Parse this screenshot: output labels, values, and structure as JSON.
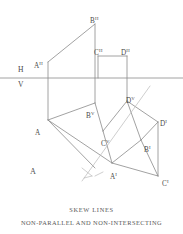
{
  "figure": {
    "panel_label": "A",
    "caption_title": "SKEW LINES",
    "caption_subtitle": "NON-PARALLEL  AND  NON-INTERSECTING",
    "stroke_color": "#8a8a8a",
    "light_stroke_color": "#b9b9b9",
    "text_color": "#4a4a4a",
    "background_color": "#ffffff"
  },
  "reference_plane": {
    "horizontal_label": "H",
    "vertical_label": "V",
    "ground_line_y": 78
  },
  "points": [
    {
      "id": "AH",
      "base": "A",
      "plane": "H",
      "label_x": 34,
      "label_y": 63,
      "x": 48,
      "y": 62
    },
    {
      "id": "BH",
      "base": "B",
      "plane": "H",
      "label_x": 90,
      "label_y": 18,
      "x": 95,
      "y": 24
    },
    {
      "id": "CH",
      "base": "C",
      "plane": "H",
      "label_x": 94,
      "label_y": 50,
      "x": 98,
      "y": 56
    },
    {
      "id": "DH",
      "base": "D",
      "plane": "H",
      "label_x": 121,
      "label_y": 50,
      "x": 127,
      "y": 56
    },
    {
      "id": "BV",
      "base": "B",
      "plane": "V",
      "label_x": 86,
      "label_y": 113,
      "x": 95,
      "y": 103
    },
    {
      "id": "CV",
      "base": "C",
      "plane": "V",
      "label_x": 101,
      "label_y": 141,
      "x": 103,
      "y": 131
    },
    {
      "id": "DV",
      "base": "D",
      "plane": "V",
      "label_x": 126,
      "label_y": 98,
      "x": 127,
      "y": 101
    },
    {
      "id": "AI",
      "base": "A",
      "plane": "I",
      "label_x": 110,
      "label_y": 174,
      "x": 112,
      "y": 163
    },
    {
      "id": "BI",
      "base": "B",
      "plane": "I",
      "label_x": 144,
      "label_y": 147,
      "x": 141,
      "y": 140
    },
    {
      "id": "CI",
      "base": "C",
      "plane": "I",
      "label_x": 162,
      "label_y": 181,
      "x": 158,
      "y": 176
    },
    {
      "id": "DI",
      "base": "D",
      "plane": "I",
      "label_x": 160,
      "label_y": 121,
      "x": 158,
      "y": 122
    },
    {
      "id": "A",
      "base": "A",
      "plane": "",
      "label_x": 35,
      "label_y": 130,
      "x": 48,
      "y": 120
    }
  ],
  "segments": [
    {
      "name": "ah-bh",
      "x1": 48,
      "y1": 62,
      "x2": 95,
      "y2": 24,
      "weight": "normal"
    },
    {
      "name": "bh-vertical",
      "x1": 95,
      "y1": 24,
      "x2": 95,
      "y2": 103,
      "weight": "normal"
    },
    {
      "name": "ch-dh",
      "x1": 98,
      "y1": 56,
      "x2": 127,
      "y2": 56,
      "weight": "normal"
    },
    {
      "name": "ch-vertical",
      "x1": 98,
      "y1": 56,
      "x2": 98,
      "y2": 78,
      "weight": "normal"
    },
    {
      "name": "dh-vertical",
      "x1": 127,
      "y1": 56,
      "x2": 127,
      "y2": 101,
      "weight": "normal"
    },
    {
      "name": "ah-a",
      "x1": 48,
      "y1": 62,
      "x2": 48,
      "y2": 120,
      "weight": "normal"
    },
    {
      "name": "ground-line",
      "x1": 0,
      "y1": 78,
      "x2": 183,
      "y2": 78,
      "weight": "normal"
    },
    {
      "name": "a-bv",
      "x1": 48,
      "y1": 120,
      "x2": 95,
      "y2": 103,
      "weight": "normal"
    },
    {
      "name": "a-ai",
      "x1": 48,
      "y1": 120,
      "x2": 112,
      "y2": 163,
      "weight": "normal"
    },
    {
      "name": "bv-cv",
      "x1": 95,
      "y1": 103,
      "x2": 103,
      "y2": 131,
      "weight": "normal"
    },
    {
      "name": "cv-dv",
      "x1": 103,
      "y1": 131,
      "x2": 127,
      "y2": 101,
      "weight": "normal"
    },
    {
      "name": "dv-di",
      "x1": 127,
      "y1": 101,
      "x2": 158,
      "y2": 122,
      "weight": "normal"
    },
    {
      "name": "cv-ai",
      "x1": 103,
      "y1": 131,
      "x2": 112,
      "y2": 163,
      "weight": "normal"
    },
    {
      "name": "ai-bi",
      "x1": 112,
      "y1": 163,
      "x2": 141,
      "y2": 140,
      "weight": "normal"
    },
    {
      "name": "bi-dv",
      "x1": 141,
      "y1": 140,
      "x2": 127,
      "y2": 101,
      "weight": "normal"
    },
    {
      "name": "bi-di",
      "x1": 141,
      "y1": 140,
      "x2": 158,
      "y2": 122,
      "weight": "normal"
    },
    {
      "name": "di-ci",
      "x1": 158,
      "y1": 122,
      "x2": 158,
      "y2": 176,
      "weight": "normal"
    },
    {
      "name": "ai-ci",
      "x1": 112,
      "y1": 163,
      "x2": 158,
      "y2": 176,
      "weight": "normal"
    },
    {
      "name": "bi-ci",
      "x1": 141,
      "y1": 140,
      "x2": 158,
      "y2": 176,
      "weight": "normal"
    },
    {
      "name": "lower-left-edge",
      "x1": 48,
      "y1": 120,
      "x2": 95,
      "y2": 168,
      "weight": "normal"
    },
    {
      "name": "skew-line",
      "x1": 150,
      "y1": 86,
      "x2": 82,
      "y2": 181,
      "weight": "light"
    },
    {
      "name": "skew-tail",
      "x1": 95,
      "y1": 176,
      "x2": 103,
      "y2": 172,
      "weight": "light"
    },
    {
      "name": "arrow-stroke1",
      "x1": 82,
      "y1": 168,
      "x2": 92,
      "y2": 176,
      "weight": "light"
    },
    {
      "name": "arrow-stroke2",
      "x1": 92,
      "y1": 176,
      "x2": 84,
      "y2": 178,
      "weight": "light"
    }
  ]
}
